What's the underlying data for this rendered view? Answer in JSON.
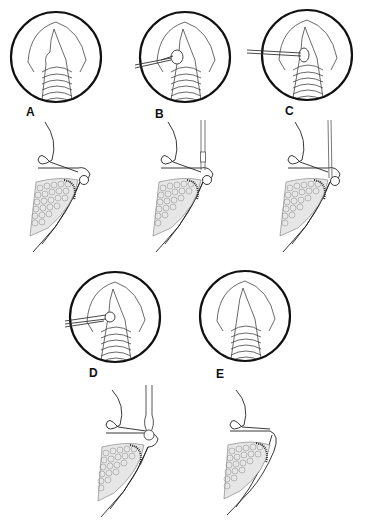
{
  "figure": {
    "type": "surgical-procedure-illustration",
    "panels": [
      {
        "id": "A",
        "label": "A",
        "instrument": "none",
        "view": "endoscopic-circle-and-sagittal"
      },
      {
        "id": "B",
        "label": "B",
        "instrument": "forceps-grasping-lesion",
        "view": "endoscopic-circle-and-sagittal"
      },
      {
        "id": "C",
        "label": "C",
        "instrument": "probe-at-lesion",
        "view": "endoscopic-circle-and-sagittal"
      },
      {
        "id": "D",
        "label": "D",
        "instrument": "forceps-removing-lesion",
        "view": "endoscopic-circle-and-sagittal"
      },
      {
        "id": "E",
        "label": "E",
        "instrument": "none",
        "view": "endoscopic-circle-and-sagittal"
      }
    ],
    "caption": ""
  },
  "colors": {
    "background": "#ffffff",
    "ink": "#111111",
    "thin_line": "#555555",
    "stipple": "#777777"
  }
}
